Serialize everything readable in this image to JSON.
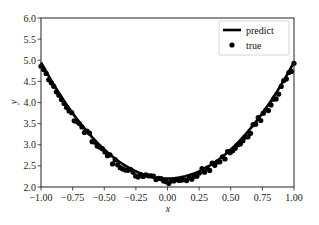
{
  "chart_data": {
    "type": "line+scatter",
    "title": "",
    "xlabel": "x",
    "ylabel": "y",
    "xlim": [
      -1.0,
      1.0
    ],
    "ylim": [
      2.0,
      6.0
    ],
    "grid": false,
    "legend_position": "upper right",
    "x_ticks": [
      "-1.00",
      "-0.75",
      "-0.50",
      "-0.25",
      "0.00",
      "0.25",
      "0.50",
      "0.75",
      "1.00"
    ],
    "y_ticks": [
      "2.0",
      "2.5",
      "3.0",
      "3.5",
      "4.0",
      "4.5",
      "5.0",
      "5.5",
      "6.0"
    ],
    "series": [
      {
        "name": "predict",
        "kind": "line",
        "color": "#000000",
        "model": "y = 2.2 + 2.75 * x^2",
        "x": [
          -1.0,
          -0.75,
          -0.5,
          -0.25,
          0.0,
          0.25,
          0.5,
          0.75,
          1.0
        ],
        "y": [
          4.95,
          3.75,
          2.89,
          2.37,
          2.2,
          2.37,
          2.89,
          3.75,
          4.95
        ]
      },
      {
        "name": "true",
        "kind": "scatter",
        "color": "#000000",
        "n_points": 100,
        "x_range": [
          -1.0,
          1.0
        ],
        "approx_y_at": {
          "-1.00": 5.05,
          "-0.75": 3.8,
          "-0.50": 2.9,
          "-0.25": 2.3,
          "0.00": 2.1,
          "0.25": 2.3,
          "0.50": 2.85,
          "0.75": 3.75,
          "1.00": 5.0
        },
        "noise_sd": 0.06
      }
    ]
  },
  "legend": {
    "items": [
      {
        "label": "predict",
        "marker": "line"
      },
      {
        "label": "true",
        "marker": "dot"
      }
    ]
  },
  "axes": {
    "xlabel": "x",
    "ylabel": "y"
  }
}
